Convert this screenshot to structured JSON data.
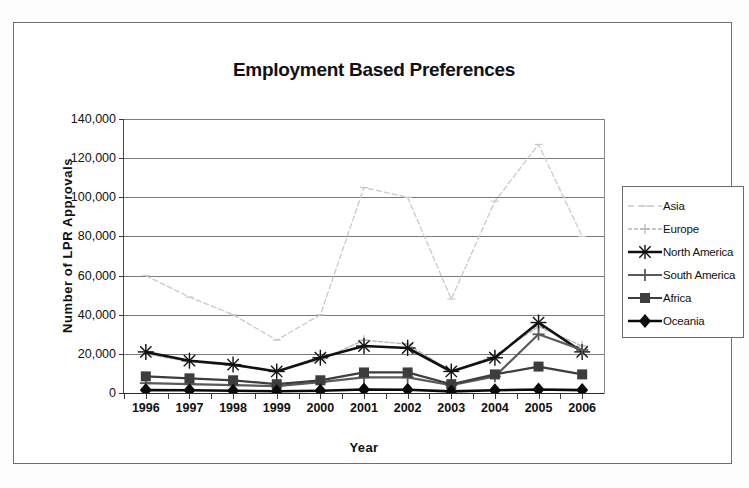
{
  "chart_data": {
    "type": "line",
    "title": "Employment Based Preferences",
    "xlabel": "Year",
    "ylabel": "Number of LPR Approvals",
    "categories": [
      "1996",
      "1997",
      "1998",
      "1999",
      "2000",
      "2001",
      "2002",
      "2003",
      "2004",
      "2005",
      "2006"
    ],
    "ylim": [
      0,
      140000
    ],
    "ytick_labels": [
      "0",
      "20,000",
      "40,000",
      "60,000",
      "80,000",
      "100,000",
      "120,000",
      "140,000"
    ],
    "ytick_values": [
      0,
      20000,
      40000,
      60000,
      80000,
      100000,
      120000,
      140000
    ],
    "grid": true,
    "legend_position": "right",
    "series": [
      {
        "name": "Asia",
        "marker": "dash",
        "color": "#c9c9c9",
        "values": [
          60000,
          49000,
          40000,
          27000,
          40000,
          105000,
          100000,
          48000,
          98000,
          127000,
          80000
        ]
      },
      {
        "name": "Europe",
        "marker": "cross-light",
        "color": "#b5b5b5",
        "values": [
          20000,
          16000,
          14000,
          11000,
          17000,
          27000,
          25000,
          11000,
          19000,
          34000,
          24000
        ]
      },
      {
        "name": "North America",
        "marker": "star",
        "color": "#111111",
        "values": [
          21000,
          16500,
          14500,
          11000,
          18000,
          24000,
          23000,
          11000,
          18000,
          36000,
          21000
        ]
      },
      {
        "name": "South America",
        "marker": "plus",
        "color": "#5a5a5a",
        "values": [
          5000,
          4500,
          4000,
          3500,
          5500,
          8000,
          8000,
          4000,
          8500,
          30000,
          22000
        ]
      },
      {
        "name": "Africa",
        "marker": "square",
        "color": "#3d3d3d",
        "values": [
          8500,
          7500,
          6500,
          4500,
          6500,
          10500,
          10500,
          4500,
          9500,
          13500,
          9500
        ]
      },
      {
        "name": "Oceania",
        "marker": "diamond",
        "color": "#0a0a0a",
        "values": [
          1500,
          1400,
          1200,
          900,
          1200,
          1800,
          1700,
          800,
          1400,
          1800,
          1500
        ]
      }
    ]
  },
  "legend": {
    "items": [
      {
        "label": "Asia"
      },
      {
        "label": "Europe"
      },
      {
        "label": "North America"
      },
      {
        "label": "South America"
      },
      {
        "label": "Africa"
      },
      {
        "label": "Oceania"
      }
    ]
  }
}
